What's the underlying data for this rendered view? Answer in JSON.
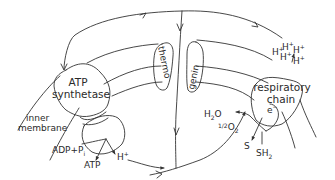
{
  "diagram": {
    "colors": {
      "line": "#333333",
      "text": "#2a2a2a",
      "background": "#ffffff"
    },
    "components": {
      "atp_synthetase": {
        "line1": "ATP",
        "line2": "synthetase"
      },
      "thermogenin": {
        "left": "thermo",
        "right": "genin"
      },
      "respiratory_chain": {
        "line1": "respiratory",
        "line2": "chain"
      },
      "inner_membrane": {
        "line1": "inner",
        "line2": "membrane"
      }
    },
    "labels": {
      "adp_pi": "ADP+P",
      "pi_sub": "i",
      "atp": "ATP",
      "h_plus_synthase": "H",
      "plus": "+",
      "h2o_h": "H",
      "h2o_2": "2",
      "h2o_o": "O",
      "half_o2_half": "1/2",
      "half_o2_o": "O",
      "half_o2_2": "2",
      "electron": "e",
      "minus": "−",
      "s": "S",
      "sh2_sh": "SH",
      "sh2_2": "2",
      "proton_cluster": [
        "H",
        "H",
        "H",
        "H",
        "H"
      ]
    }
  }
}
